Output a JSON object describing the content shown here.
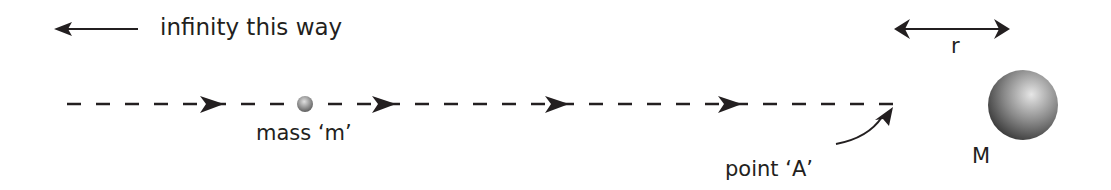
{
  "labels": {
    "infinity": "infinity this way",
    "small_mass": "mass ‘m’",
    "point_a": "point ‘A’",
    "big_mass": "M",
    "distance": "r"
  },
  "colors": {
    "ink": "#231f20",
    "sphere_light": "#e8e8e8",
    "sphere_dark": "#3a3a3a"
  }
}
